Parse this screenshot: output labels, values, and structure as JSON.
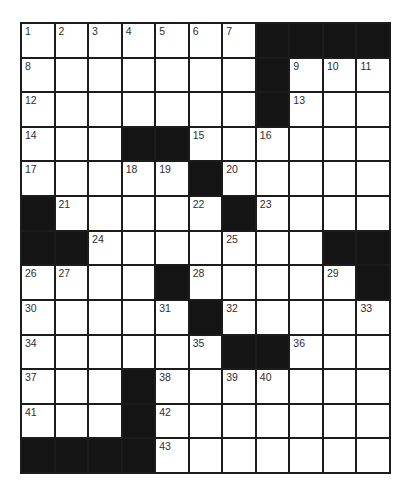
{
  "puzzle": {
    "rows": 13,
    "cols": 11,
    "colors": {
      "grid_line": "#1c1c1c",
      "block": "#141414",
      "cell": "#ffffff",
      "number": "#2e2e2e"
    },
    "layout": [
      "#######....",
      "1234567####",
      "8......#9ab",
      "c......#d..",
      "e..##f.g...",
      "h..ij#k....",
      "#l...m#n...",
      "##o...p..##",
      "qr..#s...t#",
      "u...v#w...x",
      "y....z##A..",
      "B..#C.DE...",
      "F..#G......",
      "####H......"
    ],
    "cells": [
      [
        "1",
        "2",
        "3",
        "4",
        "5",
        "6",
        "7",
        "#",
        "#",
        "#",
        "#"
      ],
      [
        "8",
        "",
        "",
        "",
        "",
        "",
        "",
        "#",
        "9",
        "10",
        "11"
      ],
      [
        "12",
        "",
        "",
        "",
        "",
        "",
        "",
        "#",
        "13",
        "",
        ""
      ],
      [
        "14",
        "",
        "",
        "#",
        "#",
        "15",
        "",
        "16",
        "",
        "",
        ""
      ],
      [
        "17",
        "",
        "",
        "18",
        "19",
        "#",
        "20",
        "",
        "",
        "",
        ""
      ],
      [
        "#",
        "21",
        "",
        "",
        "",
        "22",
        "#",
        "23",
        "",
        "",
        ""
      ],
      [
        "#",
        "#",
        "24",
        "",
        "",
        "",
        "25",
        "",
        "",
        "#",
        "#"
      ],
      [
        "26",
        "27",
        "",
        "",
        "#",
        "28",
        "",
        "",
        "",
        "29",
        "#"
      ],
      [
        "30",
        "",
        "",
        "",
        "31",
        "#",
        "32",
        "",
        "",
        "",
        "33"
      ],
      [
        "34",
        "",
        "",
        "",
        "",
        "35",
        "#",
        "#",
        "36",
        "",
        ""
      ],
      [
        "37",
        "",
        "",
        "#",
        "38",
        "",
        "39",
        "40",
        "",
        "",
        ""
      ],
      [
        "41",
        "",
        "",
        "#",
        "42",
        "",
        "",
        "",
        "",
        "",
        ""
      ],
      [
        "#",
        "#",
        "#",
        "#",
        "43",
        "",
        "",
        "",
        "",
        "",
        ""
      ]
    ]
  }
}
